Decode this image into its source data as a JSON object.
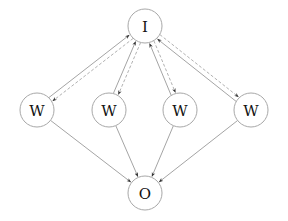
{
  "diagram": {
    "nodes": [
      {
        "id": "I",
        "label": "I",
        "x": 145,
        "y": 26,
        "r": 17
      },
      {
        "id": "W1",
        "label": "W",
        "x": 37,
        "y": 110,
        "r": 17
      },
      {
        "id": "W2",
        "label": "W",
        "x": 109,
        "y": 110,
        "r": 17
      },
      {
        "id": "W3",
        "label": "W",
        "x": 180,
        "y": 110,
        "r": 17
      },
      {
        "id": "W4",
        "label": "W",
        "x": 251,
        "y": 110,
        "r": 17
      },
      {
        "id": "O",
        "label": "O",
        "x": 145,
        "y": 193,
        "r": 17
      }
    ],
    "edges": [
      {
        "from": "I",
        "to": "W1",
        "style": "dashed"
      },
      {
        "from": "I",
        "to": "W2",
        "style": "dashed"
      },
      {
        "from": "I",
        "to": "W3",
        "style": "dashed"
      },
      {
        "from": "I",
        "to": "W4",
        "style": "dashed"
      },
      {
        "from": "W1",
        "to": "I",
        "style": "solid"
      },
      {
        "from": "W2",
        "to": "I",
        "style": "solid"
      },
      {
        "from": "W3",
        "to": "I",
        "style": "solid"
      },
      {
        "from": "W4",
        "to": "I",
        "style": "solid"
      },
      {
        "from": "W1",
        "to": "O",
        "style": "solid"
      },
      {
        "from": "W2",
        "to": "O",
        "style": "solid"
      },
      {
        "from": "W3",
        "to": "O",
        "style": "solid"
      },
      {
        "from": "W4",
        "to": "O",
        "style": "solid"
      }
    ],
    "colors": {
      "node_stroke": "#a8a8a8",
      "edge_solid": "#9a9a9a",
      "edge_dashed": "#a8a8a8",
      "arrowhead": "#333333",
      "text": "#111111"
    }
  }
}
